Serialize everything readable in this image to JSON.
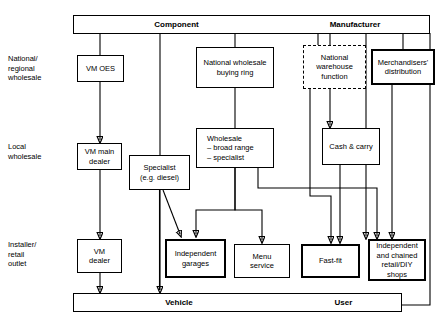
{
  "diagram": {
    "type": "flow-diagram",
    "width": 448,
    "height": 327,
    "stroke_color": "#000000",
    "background_color": "#ffffff"
  },
  "top_bar": {
    "segments": [
      {
        "label": "Component"
      },
      {
        "label": "Manufacturer"
      }
    ]
  },
  "bottom_bar": {
    "segments": [
      {
        "label": "Vehicle"
      },
      {
        "label": "User"
      }
    ]
  },
  "row_labels": [
    {
      "id": "national-regional-wholesale",
      "label": "National/\nregional\nwholesale"
    },
    {
      "id": "local-wholesale",
      "label": "Local\nwholesale"
    },
    {
      "id": "installer-retail-outlet",
      "label": "Installer/\nretail\noutlet"
    }
  ],
  "nodes": [
    {
      "id": "vm-oes",
      "label": "VM OES",
      "row": "national-regional-wholesale",
      "border": "thin"
    },
    {
      "id": "national-wholesale-buying-ring",
      "label": "National wholesale\nbuying ring",
      "row": "national-regional-wholesale",
      "border": "thin"
    },
    {
      "id": "national-warehouse-function",
      "label": "National\nwarehouse\nfunction",
      "row": "national-regional-wholesale",
      "border": "dashed"
    },
    {
      "id": "merchandisers-distribution",
      "label": "Merchandisers'\ndistribution",
      "row": "national-regional-wholesale",
      "border": "thick"
    },
    {
      "id": "vm-main-dealer",
      "label": "VM main\ndealer",
      "row": "local-wholesale",
      "border": "thin"
    },
    {
      "id": "specialist",
      "label": "Specialist\n(e.g. diesel)",
      "row": "local-wholesale",
      "border": "thin"
    },
    {
      "id": "wholesale",
      "label": "Wholesale\n– broad range\n– specialist",
      "row": "local-wholesale",
      "border": "thin"
    },
    {
      "id": "cash-and-carry",
      "label": "Cash & carry",
      "row": "local-wholesale",
      "border": "thin"
    },
    {
      "id": "vm-dealer",
      "label": "VM\ndealer",
      "row": "installer-retail-outlet",
      "border": "thin"
    },
    {
      "id": "independent-garages",
      "label": "Independent\ngarages",
      "row": "installer-retail-outlet",
      "border": "thick"
    },
    {
      "id": "menu-service",
      "label": "Menu\nservice",
      "row": "installer-retail-outlet",
      "border": "thin"
    },
    {
      "id": "fast-fit",
      "label": "Fast-fit",
      "row": "installer-retail-outlet",
      "border": "thick"
    },
    {
      "id": "independent-chained-retail-diy",
      "label": "Independent\nand chained\nretail/DIY\nshops",
      "row": "installer-retail-outlet",
      "border": "thick"
    }
  ]
}
